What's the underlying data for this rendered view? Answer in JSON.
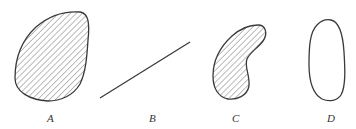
{
  "figure": {
    "shapes": [
      {
        "id": "A",
        "label": "A",
        "kind": "closed convex region",
        "hatched": true
      },
      {
        "id": "B",
        "label": "B",
        "kind": "line segment",
        "hatched": false
      },
      {
        "id": "C",
        "label": "C",
        "kind": "closed non-convex (bean-shaped) region",
        "hatched": true
      },
      {
        "id": "D",
        "label": "D",
        "kind": "closed curve (boundary only)",
        "hatched": false
      }
    ],
    "colors": {
      "stroke": "#3a3a3a",
      "hatch": "#555555",
      "background": "#ffffff"
    }
  }
}
